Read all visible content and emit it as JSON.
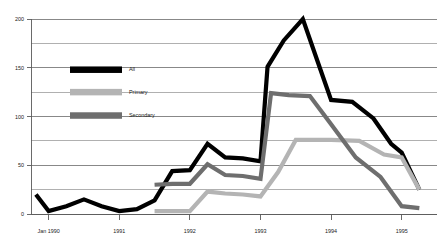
{
  "chart_data": {
    "type": "line",
    "title": "",
    "subtitle": "",
    "xlabel": "",
    "ylabel": "",
    "ylim": [
      0,
      200
    ],
    "xlim": [
      1989.75,
      1995.5
    ],
    "grid": true,
    "grid_step": 25,
    "y_ticks": [
      0,
      50,
      100,
      150,
      200
    ],
    "y_tick_labels": [
      "0",
      "50",
      "100",
      "150",
      "200"
    ],
    "x_ticks": [
      1990.0,
      1991.0,
      1992.0,
      1993.0,
      1994.0,
      1995.0
    ],
    "x_tick_labels": [
      "Jan 1990",
      "1991",
      "1992",
      "1993",
      "1994",
      "1995"
    ],
    "legend_position": "upper-left-inside",
    "colors": {
      "all": "#000000",
      "primary": "#b4b4b4",
      "secondary": "#6e6e6e",
      "gridline": "#8e8e8e",
      "axis": "#5a5a5a",
      "background": "#ffffff",
      "text": "#1a1a1a"
    },
    "series": [
      {
        "name": "All",
        "color_key": "all",
        "x": [
          1989.82,
          1990.0,
          1990.25,
          1990.5,
          1990.75,
          1991.0,
          1991.25,
          1991.5,
          1991.75,
          1992.0,
          1992.25,
          1992.5,
          1992.75,
          1993.0,
          1993.1,
          1993.33,
          1993.6,
          1993.85,
          1994.0,
          1994.3,
          1994.6,
          1994.85,
          1995.0,
          1995.25
        ],
        "values": [
          20,
          3,
          8,
          15,
          8,
          3,
          5,
          14,
          44,
          45,
          72,
          58,
          57,
          54,
          151,
          178,
          200,
          148,
          117,
          115,
          98,
          72,
          63,
          25
        ]
      },
      {
        "name": "Primary",
        "color_key": "primary",
        "x": [
          1991.5,
          1992.0,
          1992.25,
          1992.5,
          1992.75,
          1993.0,
          1993.25,
          1993.5,
          1993.75,
          1994.0,
          1994.4,
          1994.75,
          1995.0,
          1995.25
        ],
        "values": [
          3,
          3,
          23,
          21,
          20,
          18,
          43,
          76,
          76,
          76,
          75,
          61,
          58,
          25
        ]
      },
      {
        "name": "Secondary",
        "color_key": "secondary",
        "x": [
          1991.5,
          1991.75,
          1992.0,
          1992.25,
          1992.5,
          1992.75,
          1993.0,
          1993.15,
          1993.4,
          1993.7,
          1994.0,
          1994.35,
          1994.7,
          1995.0,
          1995.25
        ],
        "values": [
          30,
          31,
          31,
          51,
          40,
          39,
          36,
          124,
          122,
          121,
          92,
          58,
          38,
          8,
          6
        ]
      }
    ],
    "legend": [
      {
        "label": "All",
        "color_key": "all"
      },
      {
        "label": "Primary",
        "color_key": "primary"
      },
      {
        "label": "Secondary",
        "color_key": "secondary"
      }
    ]
  }
}
